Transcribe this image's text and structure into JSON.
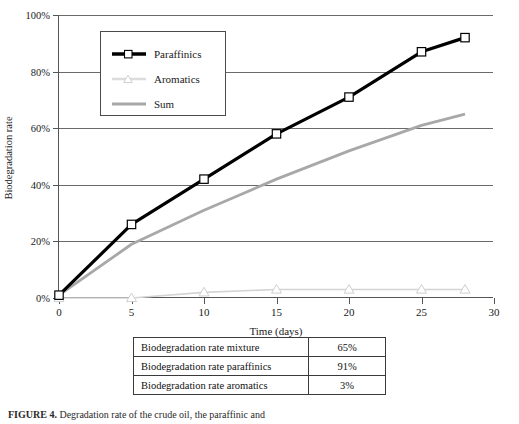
{
  "chart_data": {
    "type": "line",
    "title": "",
    "xlabel": "Time (days)",
    "ylabel": "Biodegradation rate",
    "xlim": [
      0,
      30
    ],
    "ylim": [
      0,
      100
    ],
    "xticks": [
      "0",
      "5",
      "10",
      "15",
      "20",
      "25",
      "30"
    ],
    "yticks": [
      "0%",
      "20%",
      "40%",
      "60%",
      "80%",
      "100%"
    ],
    "grid": "horizontal",
    "legend_position": "upper-left-inside",
    "series": [
      {
        "name": "Paraffinics",
        "color": "#000000",
        "marker": "square",
        "x": [
          0,
          5,
          10,
          15,
          20,
          25,
          28
        ],
        "values": [
          1,
          26,
          42,
          58,
          71,
          87,
          92
        ]
      },
      {
        "name": "Aromatics",
        "color": "#d4d4d4",
        "marker": "triangle",
        "x": [
          0,
          5,
          10,
          15,
          20,
          25,
          28
        ],
        "values": [
          0,
          0,
          2,
          3,
          3,
          3,
          3
        ]
      },
      {
        "name": "Sum",
        "color": "#a8a8a8",
        "marker": "none",
        "x": [
          0,
          5,
          10,
          15,
          20,
          25,
          28
        ],
        "values": [
          1,
          19,
          31,
          42,
          52,
          61,
          65
        ]
      }
    ]
  },
  "legend": {
    "items": [
      {
        "label": "Paraffinics"
      },
      {
        "label": "Aromatics"
      },
      {
        "label": "Sum"
      }
    ]
  },
  "summary_table": {
    "rows": [
      {
        "label": "Biodegradation rate mixture",
        "value": "65%"
      },
      {
        "label": "Biodegradation rate paraffinics",
        "value": "91%"
      },
      {
        "label": "Biodegradation rate aromatics",
        "value": "3%"
      }
    ]
  },
  "caption": {
    "prefix": "FIGURE 4.",
    "text": "Degradation rate of the crude oil, the paraffinic and"
  }
}
